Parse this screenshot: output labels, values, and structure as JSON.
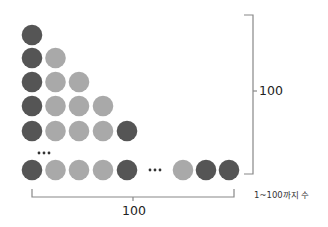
{
  "diagram": {
    "title": "",
    "colors": {
      "dark": "#555555",
      "light": "#a9a9a9",
      "line": "#888888",
      "text": "#222222"
    },
    "rows": [
      {
        "y": 35,
        "circles": [
          "dark"
        ]
      },
      {
        "y": 58,
        "circles": [
          "dark",
          "light"
        ]
      },
      {
        "y": 82,
        "circles": [
          "dark",
          "light",
          "light"
        ]
      },
      {
        "y": 106,
        "circles": [
          "dark",
          "light",
          "light",
          "light"
        ]
      },
      {
        "y": 131,
        "circles": [
          "dark",
          "light",
          "light",
          "light",
          "dark"
        ]
      }
    ],
    "bottom_row": {
      "y": 170,
      "left_circles": [
        "dark",
        "light",
        "light",
        "light",
        "dark"
      ],
      "right_circles": [
        "light",
        "dark",
        "dark"
      ]
    },
    "ellipsis_vertical": "···",
    "ellipsis_horizontal": "···",
    "vertical_bracket_label": "100",
    "horizontal_bracket_label": "100",
    "range_label": "1~100까지 수"
  }
}
